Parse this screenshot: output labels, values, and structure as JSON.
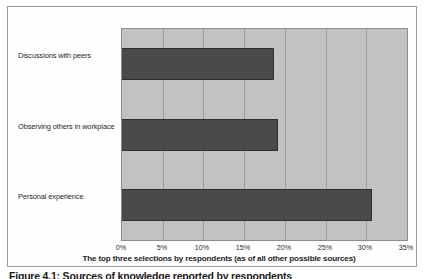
{
  "figure": {
    "caption": "Figure 4.1: Sources of knowledge reported by respondents",
    "background_color": "#ffffff",
    "frame_color": "#9a9a9a"
  },
  "chart_data": {
    "type": "bar",
    "orientation": "horizontal",
    "title": "",
    "subtitle": "",
    "xlabel": "The top three selections by respondents (as of all other possible sources)",
    "ylabel": "",
    "categories": [
      "Discussions with peers",
      "Observing others in workplace",
      "Personal experience"
    ],
    "values": [
      18.7,
      19.2,
      30.7
    ],
    "value_suffix": "%",
    "xlim": [
      0,
      35
    ],
    "xticks": [
      0,
      5,
      10,
      15,
      20,
      25,
      30,
      35
    ],
    "xtick_labels": [
      "0%",
      "5%",
      "10%",
      "15%",
      "20%",
      "25%",
      "30%",
      "35%"
    ],
    "grid": true,
    "grid_axis": "x",
    "legend": false,
    "legend_position": "none",
    "plot_background_color": "#c2c2c2",
    "bar_color": "#4a4a4a",
    "bar_border_color": "#2f2f2f",
    "gridline_color": "#9d9d9d"
  }
}
